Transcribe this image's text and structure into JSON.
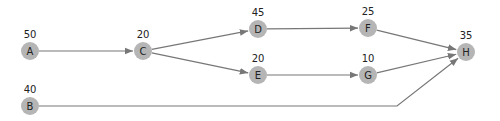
{
  "diagram": {
    "type": "activity-network",
    "nodes": [
      {
        "id": "A",
        "value": "50"
      },
      {
        "id": "B",
        "value": "40"
      },
      {
        "id": "C",
        "value": "20"
      },
      {
        "id": "D",
        "value": "45"
      },
      {
        "id": "E",
        "value": "20"
      },
      {
        "id": "F",
        "value": "25"
      },
      {
        "id": "G",
        "value": "10"
      },
      {
        "id": "H",
        "value": "35"
      }
    ],
    "edges": [
      {
        "from": "A",
        "to": "C"
      },
      {
        "from": "C",
        "to": "D"
      },
      {
        "from": "C",
        "to": "E"
      },
      {
        "from": "D",
        "to": "F"
      },
      {
        "from": "E",
        "to": "G"
      },
      {
        "from": "F",
        "to": "H"
      },
      {
        "from": "G",
        "to": "H"
      },
      {
        "from": "B",
        "to": "H"
      }
    ],
    "colors": {
      "node": "#b5b5b5",
      "edge": "#777777",
      "text": "#222222"
    }
  }
}
